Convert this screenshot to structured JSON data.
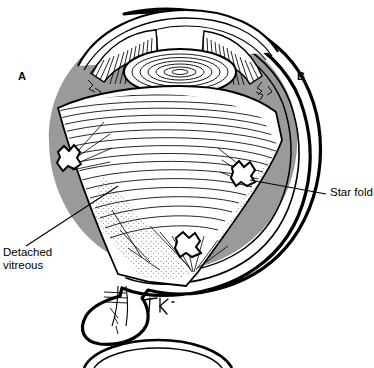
{
  "figure": {
    "labels": {
      "a": "A",
      "b": "B",
      "star_fold": "Star fold",
      "detached_vitreous": "Detached\nvitreous"
    },
    "colors": {
      "ink": "#000000",
      "retina_gray": "#9a9a9a",
      "background": "#ffffff",
      "stipple": "#555555"
    },
    "anatomy": [
      {
        "name": "sclera-outer-wall",
        "shaded": false
      },
      {
        "name": "choroid-middle-wall",
        "shaded": false
      },
      {
        "name": "retina-inner-wall",
        "shaded": true
      },
      {
        "name": "cornea",
        "shaded": false
      },
      {
        "name": "iris",
        "shaded": false
      },
      {
        "name": "lens",
        "shaded": false
      },
      {
        "name": "detached-vitreous-body",
        "shaded": false
      },
      {
        "name": "star-fold-left",
        "shaded": false
      },
      {
        "name": "star-fold-right",
        "shaded": false
      },
      {
        "name": "star-fold-bottom",
        "shaded": false
      },
      {
        "name": "optic-nerve",
        "shaded": false
      }
    ],
    "signature": "artist-signature"
  }
}
